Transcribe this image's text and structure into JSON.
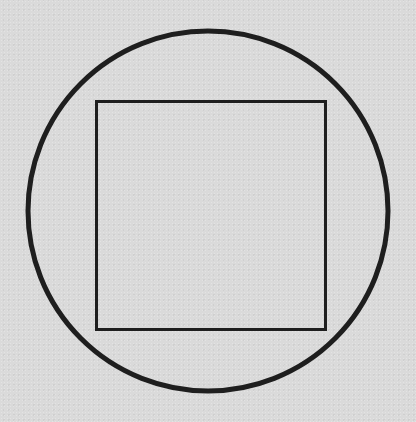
{
  "diagram": {
    "background_color": "#dadada",
    "stroke_color": "#1e1e1e",
    "shapes": [
      {
        "type": "circle",
        "name": "outer-circle",
        "cx": 208,
        "cy": 211,
        "r": 180,
        "stroke_width": 5,
        "fill": "none"
      },
      {
        "type": "square",
        "name": "inscribed-square",
        "x": 96.5,
        "y": 101.5,
        "width": 229,
        "height": 228,
        "stroke_width": 3,
        "fill": "none"
      }
    ]
  }
}
